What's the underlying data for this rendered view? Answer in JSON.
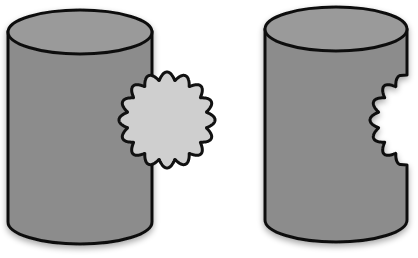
{
  "figure": {
    "left_panel": {
      "label": "cylinder-with-attached-scalloped-disc"
    },
    "right_panel": {
      "label": "cylinder-with-scalloped-cutout"
    },
    "colors": {
      "cylinder_fill": "#8c8c8c",
      "cylinder_top_fill": "#9a9a9a",
      "disc_fill": "#cfcfcf",
      "outline": "#111111",
      "background": "#ffffff"
    }
  }
}
